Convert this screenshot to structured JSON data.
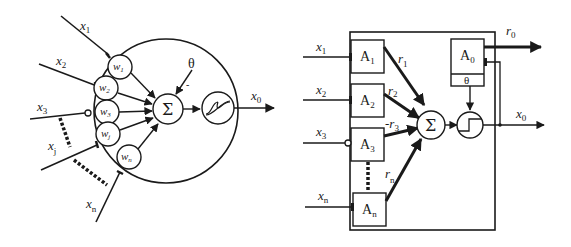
{
  "left_diagram": {
    "title": "Neuron model (weighted sum + sigmoid)",
    "inputs": [
      {
        "name": "x",
        "sub": "1",
        "type": "excitatory"
      },
      {
        "name": "x",
        "sub": "2",
        "type": "excitatory"
      },
      {
        "name": "x",
        "sub": "3",
        "type": "inhibitory"
      },
      {
        "name": "x",
        "sub": "j",
        "type": "excitatory"
      },
      {
        "name": "x",
        "sub": "n",
        "type": "excitatory"
      }
    ],
    "weights": [
      {
        "name": "w",
        "sub": "1"
      },
      {
        "name": "w",
        "sub": "2"
      },
      {
        "name": "w",
        "sub": "3"
      },
      {
        "name": "w",
        "sub": "j"
      },
      {
        "name": "w",
        "sub": "n"
      }
    ],
    "sum_symbol": "Σ",
    "threshold": "θ",
    "threshold_sign": "-",
    "activation": "sigmoid",
    "output": {
      "name": "x",
      "sub": "0"
    }
  },
  "right_diagram": {
    "title": "Adaptive block model",
    "inputs": [
      {
        "name": "x",
        "sub": "1",
        "type": "excitatory"
      },
      {
        "name": "x",
        "sub": "2",
        "type": "excitatory"
      },
      {
        "name": "x",
        "sub": "3",
        "type": "inhibitory"
      },
      {
        "name": "x",
        "sub": "n",
        "type": "excitatory"
      }
    ],
    "units": [
      {
        "name": "A",
        "sub": "1"
      },
      {
        "name": "A",
        "sub": "2"
      },
      {
        "name": "A",
        "sub": "3"
      },
      {
        "name": "A",
        "sub": "n"
      }
    ],
    "signals": [
      {
        "name": "r",
        "sub": "1",
        "prefix": ""
      },
      {
        "name": "r",
        "sub": "2",
        "prefix": ""
      },
      {
        "name": "r",
        "sub": "3",
        "prefix": "-"
      },
      {
        "name": "r",
        "sub": "n",
        "prefix": ""
      }
    ],
    "sum_symbol": "Σ",
    "output_unit": {
      "name": "A",
      "sub": "0",
      "threshold": "θ"
    },
    "activation": "step",
    "outputs": [
      {
        "name": "r",
        "sub": "0"
      },
      {
        "name": "x",
        "sub": "0"
      }
    ]
  }
}
